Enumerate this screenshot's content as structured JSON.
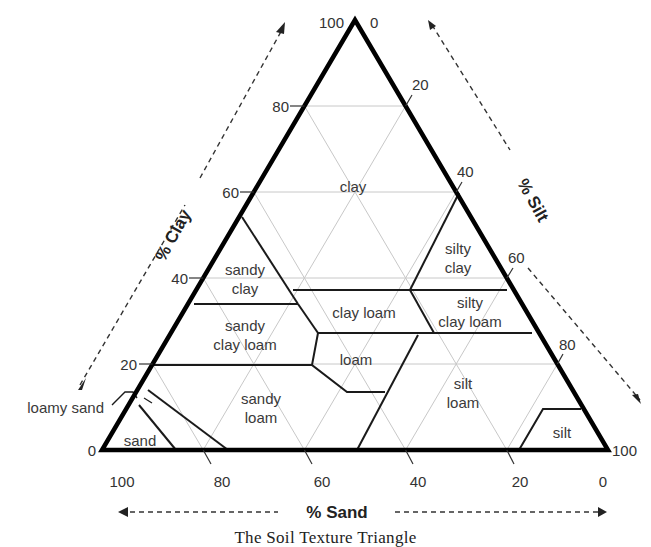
{
  "title": "The Soil Texture Triangle",
  "axes": {
    "clay": {
      "title": "% Clay",
      "ticks": [
        "0",
        "20",
        "40",
        "60",
        "80",
        "100"
      ]
    },
    "silt": {
      "title": "% Silt",
      "ticks": [
        "0",
        "20",
        "40",
        "60",
        "80",
        "100"
      ]
    },
    "sand": {
      "title": "% Sand",
      "ticks": [
        "100",
        "80",
        "60",
        "40",
        "20",
        "0"
      ]
    }
  },
  "regions": [
    {
      "name": "clay",
      "lines": [
        "clay"
      ]
    },
    {
      "name": "sandy clay",
      "lines": [
        "sandy",
        "clay"
      ]
    },
    {
      "name": "silty clay",
      "lines": [
        "silty",
        "clay"
      ]
    },
    {
      "name": "sandy clay loam",
      "lines": [
        "sandy",
        "clay loam"
      ]
    },
    {
      "name": "clay loam",
      "lines": [
        "clay loam"
      ]
    },
    {
      "name": "silty clay loam",
      "lines": [
        "silty",
        "clay loam"
      ]
    },
    {
      "name": "loam",
      "lines": [
        "loam"
      ]
    },
    {
      "name": "sandy loam",
      "lines": [
        "sandy",
        "loam"
      ]
    },
    {
      "name": "silt loam",
      "lines": [
        "silt",
        "loam"
      ]
    },
    {
      "name": "silt",
      "lines": [
        "silt"
      ]
    },
    {
      "name": "sand",
      "lines": [
        "sand"
      ]
    },
    {
      "name": "loamy sand",
      "lines": [
        "loamy sand"
      ]
    }
  ],
  "colors": {
    "outline": "#000000",
    "boundary": "#1a1a1a",
    "grid": "#c8c8c8",
    "text": "#333333"
  }
}
